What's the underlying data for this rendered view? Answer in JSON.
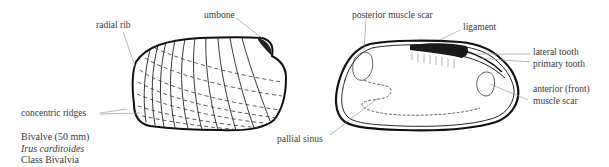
{
  "caption": {
    "line1": "Bivalve (50 mm)",
    "line2": "Irus carditoides",
    "line3": "Class Bivalvia"
  },
  "exterior_view": {
    "labels": {
      "radial_rib": "radial rib",
      "umbone": "umbone",
      "concentric_ridges": "concentric ridges"
    }
  },
  "interior_view": {
    "labels": {
      "posterior_muscle_scar": "posterior muscle scar",
      "ligament": "ligament",
      "lateral_tooth": "lateral tooth",
      "primary_tooth": "primary tooth",
      "anterior_muscle_scar_line1": "anterior (front)",
      "anterior_muscle_scar_line2": "muscle scar",
      "pallial_sinus": "pallial sinus"
    }
  }
}
